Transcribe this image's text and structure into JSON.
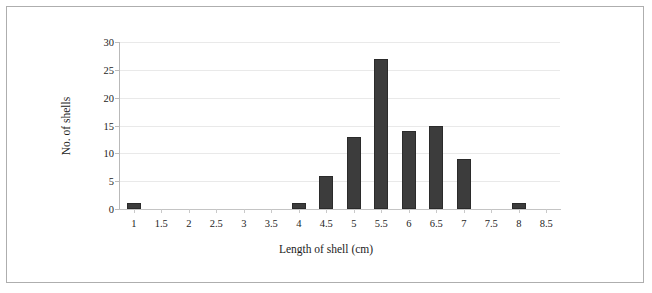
{
  "chart_data": {
    "type": "bar",
    "title": "",
    "subtitle": "",
    "xlabel": "Length of shell (cm)",
    "ylabel": "No. of shells",
    "categories": [
      "1",
      "1.5",
      "2",
      "2.5",
      "3",
      "3.5",
      "4",
      "4.5",
      "5",
      "5.5",
      "6",
      "6.5",
      "7",
      "7.5",
      "8",
      "8.5"
    ],
    "values": [
      1,
      0,
      0,
      0,
      0,
      0,
      1,
      6,
      13,
      27,
      14,
      15,
      9,
      0,
      1,
      0
    ],
    "xlim": [
      1,
      8.5
    ],
    "ylim": [
      0,
      30
    ],
    "ytick_labels": [
      "0",
      "5",
      "10",
      "15",
      "20",
      "25",
      "30"
    ],
    "ytick_values": [
      0,
      5,
      10,
      15,
      20,
      25,
      30
    ],
    "grid": "horizontal",
    "legend": "none",
    "bar_color": "#3c3c3c",
    "grid_color": "#e9e9e9",
    "axis_color": "#bdbdbd",
    "background_color": "#ffffff",
    "border_color": "#aeaeae"
  }
}
